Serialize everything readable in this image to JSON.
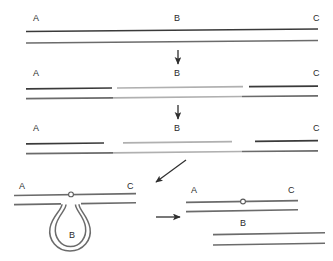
{
  "diagram": {
    "colors": {
      "strand_dark": "#3a3a3a",
      "strand_mid": "#6b6b6b",
      "strand_light": "#b0b0b0",
      "label": "#2b2b2b",
      "background": "#ffffff",
      "marker_fill": "#ffffff"
    },
    "labels": {
      "a": "A",
      "b": "B",
      "c": "C"
    },
    "panels": [
      {
        "id": "panel-1-intact-duplex",
        "name": "intact-duplex",
        "labels": [
          {
            "text": "A",
            "x": 33,
            "y": 21
          },
          {
            "text": "B",
            "x": 174,
            "y": 21
          },
          {
            "text": "C",
            "x": 313,
            "y": 21
          }
        ],
        "strands": [
          {
            "name": "top-strand",
            "segments": [
              {
                "label": "A-B-C",
                "x1": 26,
                "y1": 31.5,
                "x2": 318,
                "y2": 29.0,
                "tone": "strand_dark"
              }
            ]
          },
          {
            "name": "bottom-strand",
            "segments": [
              {
                "label": "A-B-C",
                "x1": 26,
                "y1": 43.0,
                "x2": 318,
                "y2": 40.5,
                "tone": "strand_mid"
              }
            ]
          }
        ]
      },
      {
        "id": "panel-2-nicked-duplex",
        "name": "nicked-duplex",
        "labels": [
          {
            "text": "A",
            "x": 33,
            "y": 76
          },
          {
            "text": "B",
            "x": 174,
            "y": 76
          },
          {
            "text": "C",
            "x": 313,
            "y": 76
          }
        ],
        "strands": [
          {
            "name": "top-strand",
            "segments": [
              {
                "label": "A",
                "x1": 26,
                "y1": 88.8,
                "x2": 112,
                "y2": 88.0,
                "tone": "strand_dark"
              },
              {
                "label": "B",
                "x1": 117,
                "y1": 88.0,
                "x2": 243,
                "y2": 86.7,
                "tone": "strand_light"
              },
              {
                "label": "C",
                "x1": 249,
                "y1": 86.7,
                "x2": 318,
                "y2": 86.1,
                "tone": "strand_dark"
              }
            ]
          },
          {
            "name": "bottom-strand",
            "segments": [
              {
                "label": "A",
                "x1": 26,
                "y1": 98.6,
                "x2": 113,
                "y2": 97.8,
                "tone": "strand_mid"
              },
              {
                "label": "B",
                "x1": 113,
                "y1": 97.8,
                "x2": 242,
                "y2": 96.5,
                "tone": "strand_light"
              },
              {
                "label": "C",
                "x1": 242,
                "y1": 96.5,
                "x2": 318,
                "y2": 95.8,
                "tone": "strand_mid"
              }
            ]
          }
        ]
      },
      {
        "id": "panel-3-separated-duplex",
        "name": "separated-duplex",
        "labels": [
          {
            "text": "A",
            "x": 33,
            "y": 131
          },
          {
            "text": "B",
            "x": 174,
            "y": 131
          },
          {
            "text": "C",
            "x": 313,
            "y": 131
          }
        ],
        "strands": [
          {
            "name": "top-strand",
            "segments": [
              {
                "label": "A",
                "x1": 26,
                "y1": 143.8,
                "x2": 104,
                "y2": 143.0,
                "tone": "strand_dark"
              },
              {
                "label": "B",
                "x1": 123,
                "y1": 142.8,
                "x2": 232,
                "y2": 141.6,
                "tone": "strand_light"
              },
              {
                "label": "C",
                "x1": 255,
                "y1": 141.3,
                "x2": 318,
                "y2": 140.7,
                "tone": "strand_dark"
              }
            ]
          },
          {
            "name": "bottom-strand",
            "segments": [
              {
                "label": "A",
                "x1": 26,
                "y1": 153.6,
                "x2": 113,
                "y2": 152.8,
                "tone": "strand_mid"
              },
              {
                "label": "B",
                "x1": 113,
                "y1": 152.8,
                "x2": 242,
                "y2": 151.5,
                "tone": "strand_light"
              },
              {
                "label": "C",
                "x1": 242,
                "y1": 151.5,
                "x2": 318,
                "y2": 150.8,
                "tone": "strand_mid"
              }
            ]
          }
        ]
      },
      {
        "id": "panel-4-looped-intermediate",
        "name": "looped-intermediate",
        "labels": [
          {
            "text": "A",
            "x": 19,
            "y": 189
          },
          {
            "text": "C",
            "x": 127,
            "y": 189
          },
          {
            "text": "B",
            "x": 69,
            "y": 238
          }
        ],
        "strands": [
          {
            "name": "top-strand",
            "segments": [
              {
                "label": "A-C",
                "x1": 14,
                "y1": 195.5,
                "x2": 136,
                "y2": 193.6,
                "tone": "strand_mid"
              }
            ]
          },
          {
            "name": "bottom-strand-left",
            "segments": [
              {
                "label": "A",
                "x1": 14,
                "y1": 204.6,
                "x2": 61,
                "y2": 203.9,
                "tone": "strand_mid"
              }
            ]
          },
          {
            "name": "bottom-strand-right",
            "segments": [
              {
                "label": "C",
                "x1": 81,
                "y1": 203.6,
                "x2": 136,
                "y2": 202.8,
                "tone": "strand_mid"
              }
            ]
          }
        ],
        "marker": {
          "name": "recombination-site-marker",
          "x": 71,
          "y": 194.4,
          "r": 2.4
        },
        "loop": {
          "name": "excision-loop-b",
          "label": "B"
        }
      },
      {
        "id": "panel-5-products",
        "name": "excision-products",
        "labels": [
          {
            "text": "A",
            "x": 191,
            "y": 193
          },
          {
            "text": "C",
            "x": 288,
            "y": 193
          },
          {
            "text": "B",
            "x": 240,
            "y": 226
          }
        ],
        "strands": [
          {
            "name": "ac-top-strand",
            "segments": [
              {
                "label": "A-C",
                "x1": 186,
                "y1": 202.4,
                "x2": 298,
                "y2": 200.6,
                "tone": "strand_mid"
              }
            ]
          },
          {
            "name": "ac-bottom-strand",
            "segments": [
              {
                "label": "A-C",
                "x1": 186,
                "y1": 211.6,
                "x2": 298,
                "y2": 209.8,
                "tone": "strand_mid"
              }
            ]
          },
          {
            "name": "b-top-strand",
            "segments": [
              {
                "label": "B",
                "x1": 213,
                "y1": 234.6,
                "x2": 325,
                "y2": 232.8,
                "tone": "strand_mid"
              }
            ]
          },
          {
            "name": "b-bottom-strand",
            "segments": [
              {
                "label": "B",
                "x1": 213,
                "y1": 245.0,
                "x2": 325,
                "y2": 243.2,
                "tone": "strand_mid"
              }
            ]
          }
        ],
        "marker": {
          "name": "recombination-site-marker",
          "x": 243,
          "y": 201.5,
          "r": 2.4
        }
      }
    ],
    "arrows": [
      {
        "name": "arrow-step-1-to-2",
        "direction": "down",
        "x1": 178,
        "y1": 50,
        "x2": 178,
        "y2": 64
      },
      {
        "name": "arrow-step-2-to-3",
        "direction": "down",
        "x1": 178,
        "y1": 105,
        "x2": 178,
        "y2": 119
      },
      {
        "name": "arrow-step-3-to-4",
        "direction": "down-left",
        "x1": 186,
        "y1": 160,
        "x2": 156,
        "y2": 182
      },
      {
        "name": "arrow-step-4-to-5",
        "direction": "right",
        "x1": 156,
        "y1": 217,
        "x2": 180,
        "y2": 217
      }
    ]
  }
}
